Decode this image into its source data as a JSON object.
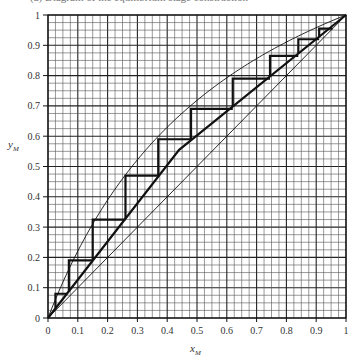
{
  "header": {
    "cut_off_caption": "(a) Diagram of the equilibrium stage construction"
  },
  "chart_data": {
    "type": "line",
    "xlabel": "x_M",
    "ylabel": "y_M",
    "xlabel_main": "x",
    "xlabel_sub": "M",
    "ylabel_main": "y",
    "ylabel_sub": "M",
    "xlim": [
      0,
      1
    ],
    "ylim": [
      0,
      1
    ],
    "grid": true,
    "minor_grid_step": 0.025,
    "major_grid_step": 0.1,
    "x_ticks": [
      "0",
      "0.1",
      "0.2",
      "0.3",
      "0.4",
      "0.5",
      "0.6",
      "0.7",
      "0.8",
      "0.9",
      "1"
    ],
    "y_ticks": [
      "0",
      "0.1",
      "0.2",
      "0.3",
      "0.4",
      "0.5",
      "0.6",
      "0.7",
      "0.8",
      "0.9",
      "1"
    ],
    "series": [
      {
        "name": "diagonal",
        "style": "thin",
        "x": [
          0,
          1
        ],
        "y": [
          0,
          1
        ]
      },
      {
        "name": "equilibrium curve",
        "style": "thin",
        "x": [
          0,
          0.025,
          0.07,
          0.15,
          0.26,
          0.37,
          0.48,
          0.61,
          0.74,
          0.84,
          0.91,
          1
        ],
        "y": [
          0,
          0.08,
          0.19,
          0.33,
          0.47,
          0.59,
          0.69,
          0.79,
          0.87,
          0.92,
          0.955,
          1
        ]
      },
      {
        "name": "operating line",
        "style": "thick",
        "x": [
          0,
          0.44,
          1
        ],
        "y": [
          0,
          0.555,
          1
        ]
      },
      {
        "name": "stages",
        "style": "thick",
        "steps": [
          {
            "x_start": 0.025,
            "x_end": 0.065,
            "y": 0.08
          },
          {
            "x_start": 0.07,
            "x_end": 0.15,
            "y": 0.19
          },
          {
            "x_start": 0.15,
            "x_end": 0.26,
            "y": 0.325
          },
          {
            "x_start": 0.26,
            "x_end": 0.37,
            "y": 0.47
          },
          {
            "x_start": 0.37,
            "x_end": 0.48,
            "y": 0.59
          },
          {
            "x_start": 0.48,
            "x_end": 0.62,
            "y": 0.69
          },
          {
            "x_start": 0.62,
            "x_end": 0.745,
            "y": 0.79
          },
          {
            "x_start": 0.745,
            "x_end": 0.84,
            "y": 0.865
          },
          {
            "x_start": 0.84,
            "x_end": 0.91,
            "y": 0.92
          },
          {
            "x_start": 0.91,
            "x_end": 0.955,
            "y": 0.955
          }
        ]
      }
    ]
  }
}
